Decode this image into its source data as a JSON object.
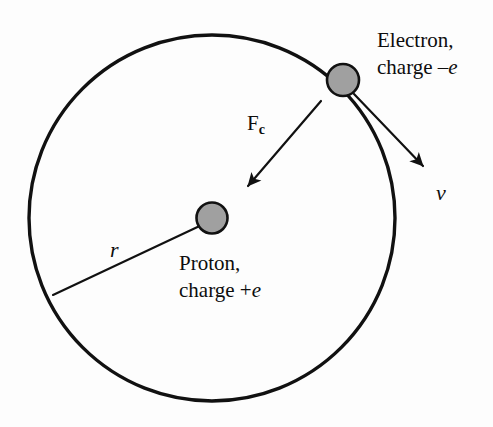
{
  "figure": {
    "background_color": "#fdfdfd",
    "stroke_color": "#111111",
    "particle_fill_color": "#a0a0a0"
  },
  "labels": {
    "electron": {
      "line1": "Electron,",
      "line2_prefix": "charge –",
      "line2_symbol": "e"
    },
    "proton": {
      "line1": "Proton,",
      "line2_prefix": "charge +",
      "line2_symbol": "e"
    },
    "force": {
      "symbol": "F",
      "subscript": "c"
    },
    "velocity": {
      "symbol": "v"
    },
    "radius": {
      "symbol": "r"
    }
  },
  "geometry": {
    "orbit": {
      "cx": 212,
      "cy": 218,
      "r": 183,
      "stroke_width": 3.4
    },
    "proton": {
      "cx": 212,
      "cy": 218,
      "r": 15.5
    },
    "electron": {
      "cx": 343,
      "cy": 80,
      "r": 16
    },
    "force_arrow": {
      "x1": 321,
      "y1": 101,
      "x2": 245,
      "y2": 189
    },
    "velocity_arrow": {
      "x1": 354,
      "y1": 94,
      "x2": 427,
      "y2": 170
    },
    "radius_line": {
      "x1": 53,
      "y1": 295,
      "x2": 206,
      "y2": 223
    }
  }
}
